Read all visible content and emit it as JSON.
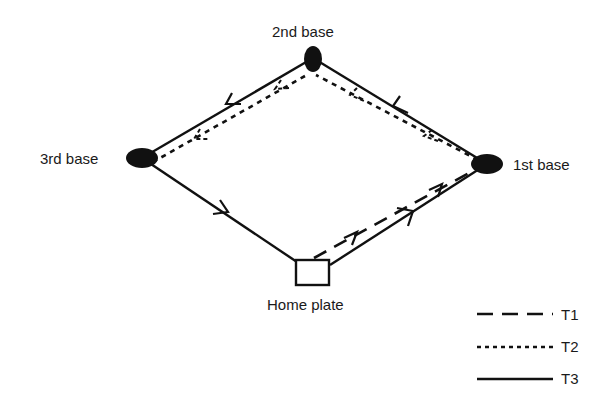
{
  "diagram": {
    "colors": {
      "line": "#111111",
      "background": "#ffffff"
    },
    "bases": [
      {
        "id": "second",
        "label": "2nd base",
        "shape": "ellipse"
      },
      {
        "id": "third",
        "label": "3rd base",
        "shape": "ellipse"
      },
      {
        "id": "first",
        "label": "1st base",
        "shape": "ellipse"
      },
      {
        "id": "home",
        "label": "Home plate",
        "shape": "square"
      }
    ],
    "paths": [
      {
        "name": "T1",
        "style": "dashed",
        "route": [
          "Home plate",
          "1st base"
        ]
      },
      {
        "name": "T2",
        "style": "dotted",
        "route": [
          "1st base",
          "2nd base",
          "3rd base"
        ]
      },
      {
        "name": "T3",
        "style": "solid",
        "route": [
          "Home plate",
          "1st base",
          "2nd base",
          "3rd base",
          "Home plate"
        ]
      }
    ],
    "legend": [
      {
        "label": "T1",
        "style": "dashed"
      },
      {
        "label": "T2",
        "style": "dotted"
      },
      {
        "label": "T3",
        "style": "solid"
      }
    ]
  }
}
